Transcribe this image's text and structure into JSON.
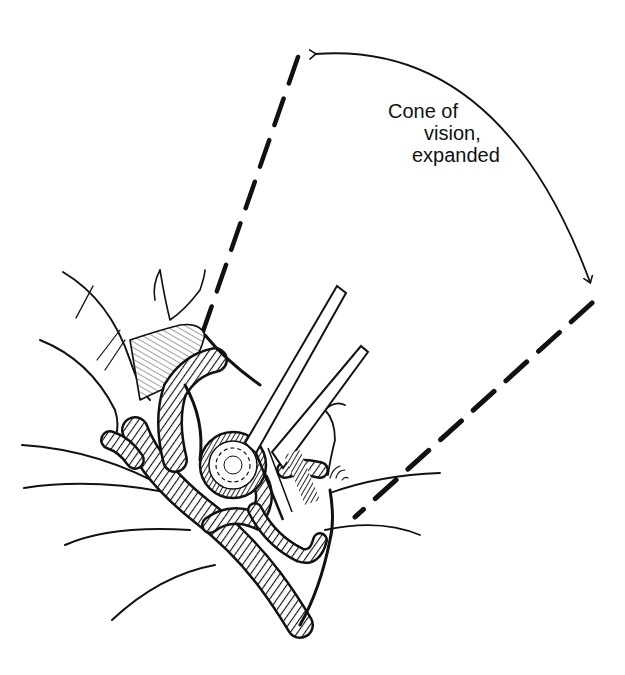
{
  "figure": {
    "type": "surgical-illustration",
    "background": "#ffffff",
    "ink_color": "#111111",
    "label": {
      "lines": [
        "Cone of",
        "vision,",
        "expanded"
      ],
      "line1": "Cone of",
      "line2": "vision,",
      "line3": "expanded"
    },
    "cone_edges": {
      "left": {
        "from": [
          298,
          57
        ],
        "to": [
          200,
          340
        ]
      },
      "right": {
        "from": [
          592,
          303
        ],
        "to": [
          355,
          517
        ]
      }
    },
    "arc": {
      "from": [
        315,
        53
      ],
      "to": [
        590,
        282
      ],
      "arrowheads": "both"
    },
    "instrument": "retractor / dissector blades entering the surgical field",
    "structures": [
      "brain gyri contours",
      "coiled vessels",
      "aneurysm dome",
      "retractor"
    ]
  }
}
